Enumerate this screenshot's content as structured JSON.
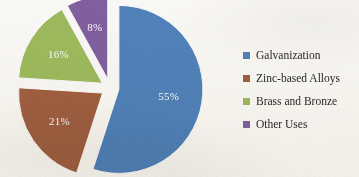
{
  "background_color": "#fdfcfa",
  "chart_data": {
    "type": "pie",
    "title": "",
    "subtitle": "",
    "xlabel": "",
    "ylabel": "",
    "grid": false,
    "exploded": true,
    "legend_position": "right",
    "value_unit": "%",
    "categories": [
      "Galvanization",
      "Zinc-based Alloys",
      "Brass and Bronze",
      "Other Uses"
    ],
    "values": [
      55,
      21,
      16,
      8
    ],
    "data_labels": [
      "55%",
      "21%",
      "16%",
      "8%"
    ],
    "colors": [
      "#4a7ebb",
      "#9e5a3a",
      "#9bba58",
      "#7d5a9e"
    ],
    "slices": [
      {
        "label": "Galvanization",
        "value": 55,
        "data_label": "55%",
        "color": "#4a7ebb",
        "start_angle_deg": 0,
        "end_angle_deg": 198,
        "label_color": "#ffffff"
      },
      {
        "label": "Zinc-based Alloys",
        "value": 21,
        "data_label": "21%",
        "color": "#9e5a3a",
        "start_angle_deg": 198,
        "end_angle_deg": 273.6,
        "label_color": "#ffffff"
      },
      {
        "label": "Brass and Bronze",
        "value": 16,
        "data_label": "16%",
        "color": "#9bba58",
        "start_angle_deg": 273.6,
        "end_angle_deg": 331.2,
        "label_color": "#ffffff"
      },
      {
        "label": "Other Uses",
        "value": 8,
        "data_label": "8%",
        "color": "#7d5a9e",
        "start_angle_deg": 331.2,
        "end_angle_deg": 360,
        "label_color": "#ffffff"
      }
    ]
  },
  "legend": {
    "items": [
      {
        "label": "Galvanization",
        "color": "#4a7ebb"
      },
      {
        "label": "Zinc-based Alloys",
        "color": "#9e5a3a"
      },
      {
        "label": "Brass and Bronze",
        "color": "#9bba58"
      },
      {
        "label": "Other Uses",
        "color": "#7d5a9e"
      }
    ]
  }
}
